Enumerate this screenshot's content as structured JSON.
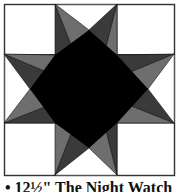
{
  "figure": {
    "type": "quilt-block",
    "pattern": "eight-pointed star",
    "colors": {
      "background": "#ffffff",
      "border": "#555555",
      "center": "#000000",
      "dark_point": "#3a3a3a",
      "medium_point": "#6e6e6e"
    }
  },
  "caption": {
    "text": "• 12½\" The Night Watch"
  }
}
